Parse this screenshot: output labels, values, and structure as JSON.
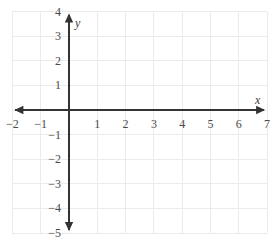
{
  "chart_data": {
    "type": "scatter",
    "title": "",
    "xlabel": "x",
    "ylabel": "y",
    "xlim": [
      -2,
      7
    ],
    "ylim": [
      -5,
      4
    ],
    "grid": true,
    "legend": null,
    "series": [],
    "x_ticks": [
      -2,
      -1,
      1,
      2,
      3,
      4,
      5,
      6,
      7
    ],
    "y_ticks": [
      4,
      3,
      2,
      1,
      -1,
      -2,
      -3,
      -4,
      -5
    ],
    "x_tick_labels": [
      "−2",
      "−1",
      "1",
      "2",
      "3",
      "4",
      "5",
      "6",
      "7"
    ],
    "y_tick_labels": [
      "4",
      "3",
      "2",
      "1",
      "−1",
      "−2",
      "−3",
      "−4",
      "−5"
    ],
    "origin_label": "",
    "x_axis_arrows": "both",
    "y_axis_arrows": "both",
    "colors": {
      "background": "#ffffff",
      "grid": "#ebebeb",
      "axis": "#333333",
      "tick_text": "#4a4a4a",
      "axis_label": "#3a3a3a"
    }
  },
  "geometry": {
    "width": 276,
    "height": 248,
    "origin_x": 69,
    "origin_y": 110,
    "unit_x": 28.3,
    "unit_y": 24.6
  }
}
